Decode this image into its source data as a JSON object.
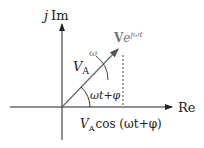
{
  "diagram": {
    "axes": {
      "imag_label_j": "j",
      "imag_label": "Im",
      "real_label": "Re"
    },
    "phasor": {
      "label_V": "V",
      "label_sub": "A",
      "rotating_label_V": "V",
      "rotating_label_exp": "e",
      "rotating_label_sup": "jωt",
      "omega_label": "ω",
      "angle_label": "ωt+φ",
      "projection_label_V": "V",
      "projection_label_sub": "A",
      "projection_label_rest": "cos (ωt+φ)"
    },
    "colors": {
      "axis": "#222222",
      "vector": "#666666",
      "dashed": "#444444"
    }
  }
}
